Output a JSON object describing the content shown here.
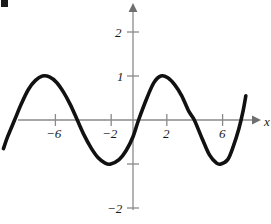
{
  "chart_data": {
    "type": "line",
    "title": "",
    "subtitle": "",
    "xlabel": "x",
    "ylabel": "",
    "xlim": [
      -9.3,
      9.0
    ],
    "ylim": [
      -2.65,
      2.45
    ],
    "grid": false,
    "legend": null,
    "annotations": [],
    "x_ticks": [
      {
        "value": -6,
        "label": "−6"
      },
      {
        "value": -2,
        "label": "−2"
      },
      {
        "value": 2,
        "label": "2"
      },
      {
        "value": 6,
        "label": "6"
      }
    ],
    "y_ticks": [
      {
        "value": 2,
        "label": "2"
      },
      {
        "value": 1,
        "label": "1"
      },
      {
        "value": -1,
        "label": ""
      },
      {
        "value": -2,
        "label": "−2"
      }
    ],
    "series": [
      {
        "name": "curve",
        "description": "sinusoid, amplitude 1, period 8, peak at x = 2",
        "amplitude": 1,
        "period": 8,
        "phase_peak_x": 2,
        "x_start": -9.3,
        "x_end": 8.1,
        "color": "#111111",
        "line_width": 3.6,
        "points": [
          {
            "x": -9.3,
            "y": -0.65
          },
          {
            "x": -9.0,
            "y": -0.38
          },
          {
            "x": -8.5,
            "y": 0.0
          },
          {
            "x": -8.0,
            "y": 0.38
          },
          {
            "x": -7.5,
            "y": 0.7
          },
          {
            "x": -7.0,
            "y": 0.9
          },
          {
            "x": -6.5,
            "y": 1.0
          },
          {
            "x": -6.0,
            "y": 0.98
          },
          {
            "x": -5.5,
            "y": 0.86
          },
          {
            "x": -5.0,
            "y": 0.64
          },
          {
            "x": -4.5,
            "y": 0.35
          },
          {
            "x": -4.0,
            "y": 0.0
          },
          {
            "x": -3.5,
            "y": -0.35
          },
          {
            "x": -3.0,
            "y": -0.64
          },
          {
            "x": -2.5,
            "y": -0.86
          },
          {
            "x": -2.0,
            "y": -0.98
          },
          {
            "x": -1.6,
            "y": -1.0
          },
          {
            "x": -1.0,
            "y": -0.9
          },
          {
            "x": -0.5,
            "y": -0.7
          },
          {
            "x": 0.0,
            "y": -0.38
          },
          {
            "x": 0.4,
            "y": 0.0
          },
          {
            "x": 1.0,
            "y": 0.5
          },
          {
            "x": 1.5,
            "y": 0.85
          },
          {
            "x": 2.0,
            "y": 1.0
          },
          {
            "x": 2.5,
            "y": 0.96
          },
          {
            "x": 3.0,
            "y": 0.8
          },
          {
            "x": 3.5,
            "y": 0.55
          },
          {
            "x": 4.0,
            "y": 0.2
          },
          {
            "x": 4.4,
            "y": 0.0
          },
          {
            "x": 5.0,
            "y": -0.45
          },
          {
            "x": 5.5,
            "y": -0.8
          },
          {
            "x": 6.0,
            "y": -0.98
          },
          {
            "x": 6.3,
            "y": -1.0
          },
          {
            "x": 6.8,
            "y": -0.9
          },
          {
            "x": 7.2,
            "y": -0.6
          },
          {
            "x": 7.6,
            "y": -0.2
          },
          {
            "x": 7.9,
            "y": 0.2
          },
          {
            "x": 8.1,
            "y": 0.55
          }
        ]
      }
    ],
    "axes": {
      "x_axis_label": "x",
      "x_arrow": true,
      "y_arrow": true,
      "axis_color": "#888888",
      "origin_label": ""
    }
  },
  "figure": {
    "corner_marker": "corner-mark",
    "background_color": "#ffffff"
  }
}
